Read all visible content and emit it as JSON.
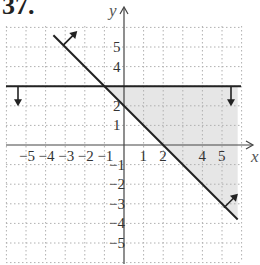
{
  "problem": {
    "number": "37."
  },
  "chart_data": {
    "type": "line",
    "title": "",
    "xlabel": "x",
    "ylabel": "y",
    "xlim": [
      -6,
      6
    ],
    "ylim": [
      -6,
      6
    ],
    "grid": true,
    "x_ticks": [
      "-5",
      "-4",
      "-3",
      "-2",
      "-1",
      "1",
      "2",
      "4",
      "5"
    ],
    "y_ticks": [
      "5",
      "4",
      "2",
      "1",
      "-1",
      "-2",
      "-3",
      "-4",
      "-5"
    ],
    "x_tick_values": [
      -5,
      -4,
      -3,
      -2,
      -1,
      1,
      2,
      4,
      5
    ],
    "y_tick_values": [
      5,
      4,
      2,
      1,
      -1,
      -2,
      -3,
      -4,
      -5
    ],
    "series": [
      {
        "name": "y = 3 (boundary, shade below)",
        "equation": "y = 3",
        "points": [
          [
            -6,
            3
          ],
          [
            6,
            3
          ]
        ],
        "shade_direction": "below"
      },
      {
        "name": "y = -x + 2 (boundary, shade above)",
        "equation": "y = -x + 2",
        "points": [
          [
            -3.5,
            5.5
          ],
          [
            5.8,
            -3.8
          ]
        ],
        "shade_direction": "above"
      }
    ],
    "shaded_region": {
      "description": "Intersection: y <= 3 and y >= -x + 2",
      "vertices": [
        [
          -1,
          3
        ],
        [
          5.8,
          3
        ],
        [
          5.8,
          -3.8
        ]
      ],
      "color": "#e6e6e6"
    },
    "line_color": "#222222",
    "grid_color": "#b0b0b0"
  }
}
